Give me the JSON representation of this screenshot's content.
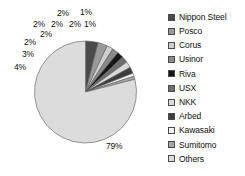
{
  "chart_data": {
    "type": "pie",
    "title": "",
    "legend_position": "right",
    "categories": [
      "Nippon Steel",
      "Posco",
      "Corus",
      "Usinor",
      "Riva",
      "USX",
      "NKK",
      "Arbed",
      "Kawasaki",
      "Sumitomo",
      "Others"
    ],
    "values": [
      4,
      3,
      2,
      2,
      2,
      2,
      2,
      2,
      1,
      1,
      79
    ],
    "labels": [
      "4%",
      "3%",
      "2%",
      "2%",
      "2%",
      "2%",
      "2%",
      "2%",
      "1%",
      "1%",
      "79%"
    ],
    "colors": [
      "#4a4a4a",
      "#9a9a9a",
      "#cfcfcf",
      "#8a8a8a",
      "#161616",
      "#6e6e6e",
      "#d9d9d9",
      "#3d3d3d",
      "#f4f4f4",
      "#a8a8a8",
      "#dcdcdc"
    ],
    "units": "percent"
  },
  "pie": {
    "slice_labels": [
      {
        "text": "2%",
        "x": 57,
        "y": 9
      },
      {
        "text": "1%",
        "x": 80,
        "y": 8
      },
      {
        "text": "2%",
        "x": 33,
        "y": 20
      },
      {
        "text": "2%",
        "x": 51,
        "y": 20
      },
      {
        "text": "2%",
        "x": 69,
        "y": 20
      },
      {
        "text": "1%",
        "x": 84,
        "y": 20
      },
      {
        "text": "2%",
        "x": 40,
        "y": 30
      },
      {
        "text": "2%",
        "x": 24,
        "y": 38
      },
      {
        "text": "3%",
        "x": 22,
        "y": 50
      },
      {
        "text": "4%",
        "x": 14,
        "y": 63
      },
      {
        "text": "79%",
        "x": 106,
        "y": 142
      }
    ]
  },
  "legend": {
    "items": [
      {
        "label": "Nippon Steel",
        "color": "#4a4a4a"
      },
      {
        "label": "Posco",
        "color": "#9a9a9a"
      },
      {
        "label": "Corus",
        "color": "#cfcfcf"
      },
      {
        "label": "Usinor",
        "color": "#8a8a8a"
      },
      {
        "label": "Riva",
        "color": "#161616"
      },
      {
        "label": "USX",
        "color": "#6e6e6e"
      },
      {
        "label": "NKK",
        "color": "#d9d9d9"
      },
      {
        "label": "Arbed",
        "color": "#3d3d3d"
      },
      {
        "label": "Kawasaki",
        "color": "#f4f4f4"
      },
      {
        "label": "Sumitomo",
        "color": "#a8a8a8"
      },
      {
        "label": "Others",
        "color": "#dcdcdc"
      }
    ]
  }
}
